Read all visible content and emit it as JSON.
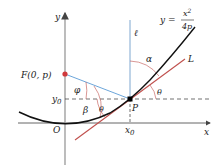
{
  "diagram": {
    "equation": {
      "lhs": "y =",
      "numerator": "x",
      "exp": "2",
      "denominator": "4p"
    },
    "axes": {
      "x_label": "x",
      "y_label": "y",
      "origin_label": "O"
    },
    "points": {
      "focus": {
        "label": "F(0, p)",
        "color": "#d0393b"
      },
      "tangent_point": {
        "label": "P",
        "color": "#000000"
      }
    },
    "ticks": {
      "x0_main": "x",
      "x0_sub": "0",
      "y0_main": "y",
      "y0_sub": "0"
    },
    "lines": {
      "vertical_line_label": "ℓ",
      "tangent_label": "L",
      "tangent_color": "#c0504d",
      "focal_line_color": "#5b9bd5",
      "vertical_line_color": "#7fa7d0",
      "curve_color": "#111111"
    },
    "angles": {
      "alpha": "α",
      "theta_right": "θ",
      "phi": "φ",
      "beta": "β",
      "theta_left": "θ"
    }
  }
}
